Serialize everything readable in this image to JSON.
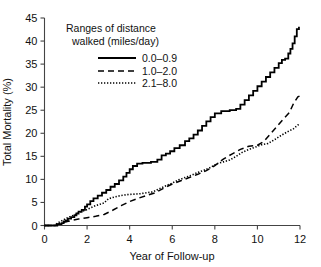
{
  "chart_data": {
    "type": "line",
    "title": "",
    "xlabel": "Year of Follow-up",
    "ylabel": "Total Mortality (%)",
    "xlim": [
      0,
      12
    ],
    "ylim": [
      0,
      45
    ],
    "xticks": [
      "0",
      "2",
      "4",
      "6",
      "8",
      "10",
      "12"
    ],
    "yticks": [
      "0",
      "5",
      "10",
      "15",
      "20",
      "25",
      "30",
      "35",
      "40",
      "45"
    ],
    "grid": false,
    "legend_position": "upper-left-inside",
    "legend_title_line1": "Ranges of distance",
    "legend_title_line2": "walked (miles/day)",
    "series": [
      {
        "name": "0.0–0.9",
        "style": "solid",
        "points": [
          [
            0.0,
            0.0
          ],
          [
            0.5,
            0.0
          ],
          [
            0.6,
            0.3
          ],
          [
            0.8,
            0.5
          ],
          [
            0.9,
            0.9
          ],
          [
            1.0,
            1.1
          ],
          [
            1.1,
            1.5
          ],
          [
            1.25,
            1.8
          ],
          [
            1.4,
            2.2
          ],
          [
            1.5,
            2.6
          ],
          [
            1.6,
            3.0
          ],
          [
            1.75,
            3.4
          ],
          [
            1.9,
            4.1
          ],
          [
            2.0,
            4.6
          ],
          [
            2.15,
            5.3
          ],
          [
            2.3,
            5.9
          ],
          [
            2.5,
            6.5
          ],
          [
            2.7,
            7.1
          ],
          [
            2.9,
            7.7
          ],
          [
            3.1,
            8.4
          ],
          [
            3.3,
            9.0
          ],
          [
            3.5,
            9.8
          ],
          [
            3.7,
            10.6
          ],
          [
            3.85,
            11.4
          ],
          [
            4.0,
            12.2
          ],
          [
            4.15,
            12.9
          ],
          [
            4.35,
            13.4
          ],
          [
            4.6,
            13.6
          ],
          [
            5.0,
            13.8
          ],
          [
            5.3,
            14.3
          ],
          [
            5.5,
            15.2
          ],
          [
            5.7,
            15.6
          ],
          [
            5.9,
            16.1
          ],
          [
            6.1,
            16.8
          ],
          [
            6.35,
            17.4
          ],
          [
            6.6,
            18.3
          ],
          [
            6.8,
            18.9
          ],
          [
            7.0,
            19.7
          ],
          [
            7.2,
            20.6
          ],
          [
            7.4,
            21.6
          ],
          [
            7.6,
            22.6
          ],
          [
            7.8,
            23.5
          ],
          [
            8.0,
            24.3
          ],
          [
            8.3,
            24.8
          ],
          [
            8.7,
            25.0
          ],
          [
            9.0,
            25.3
          ],
          [
            9.2,
            26.2
          ],
          [
            9.4,
            27.2
          ],
          [
            9.6,
            28.2
          ],
          [
            9.8,
            29.2
          ],
          [
            10.0,
            30.2
          ],
          [
            10.2,
            31.2
          ],
          [
            10.4,
            32.2
          ],
          [
            10.6,
            33.2
          ],
          [
            10.8,
            34.2
          ],
          [
            11.0,
            35.2
          ],
          [
            11.15,
            35.9
          ],
          [
            11.3,
            36.2
          ],
          [
            11.45,
            37.3
          ],
          [
            11.55,
            38.3
          ],
          [
            11.65,
            39.5
          ],
          [
            11.75,
            41.0
          ],
          [
            11.85,
            42.6
          ],
          [
            11.95,
            43.1
          ]
        ]
      },
      {
        "name": "1.0–2.0",
        "style": "dashed",
        "points": [
          [
            0.0,
            0.0
          ],
          [
            0.5,
            0.0
          ],
          [
            0.7,
            0.4
          ],
          [
            1.0,
            0.8
          ],
          [
            1.3,
            1.1
          ],
          [
            1.6,
            1.4
          ],
          [
            2.0,
            1.7
          ],
          [
            2.4,
            2.0
          ],
          [
            2.8,
            2.4
          ],
          [
            3.2,
            3.3
          ],
          [
            3.6,
            4.3
          ],
          [
            4.0,
            5.2
          ],
          [
            4.4,
            5.9
          ],
          [
            4.8,
            6.5
          ],
          [
            5.2,
            7.1
          ],
          [
            5.6,
            8.1
          ],
          [
            6.0,
            9.0
          ],
          [
            6.4,
            9.7
          ],
          [
            6.8,
            10.4
          ],
          [
            7.2,
            11.1
          ],
          [
            7.6,
            11.9
          ],
          [
            8.0,
            13.0
          ],
          [
            8.4,
            14.4
          ],
          [
            8.8,
            15.5
          ],
          [
            9.2,
            16.5
          ],
          [
            9.6,
            17.2
          ],
          [
            10.0,
            17.4
          ],
          [
            10.3,
            18.2
          ],
          [
            10.6,
            19.8
          ],
          [
            10.9,
            21.4
          ],
          [
            11.2,
            23.0
          ],
          [
            11.5,
            24.5
          ],
          [
            11.7,
            26.5
          ],
          [
            11.9,
            27.9
          ],
          [
            12.0,
            28.1
          ]
        ]
      },
      {
        "name": "2.1–8.0",
        "style": "dotted",
        "points": [
          [
            0.0,
            0.0
          ],
          [
            0.45,
            0.0
          ],
          [
            0.6,
            0.5
          ],
          [
            0.8,
            1.0
          ],
          [
            1.0,
            1.5
          ],
          [
            1.2,
            1.9
          ],
          [
            1.4,
            2.3
          ],
          [
            1.6,
            2.7
          ],
          [
            1.8,
            3.1
          ],
          [
            2.0,
            3.5
          ],
          [
            2.2,
            3.9
          ],
          [
            2.4,
            4.3
          ],
          [
            2.6,
            4.6
          ],
          [
            2.8,
            4.9
          ],
          [
            3.0,
            5.8
          ],
          [
            3.3,
            6.2
          ],
          [
            3.6,
            6.5
          ],
          [
            3.9,
            6.7
          ],
          [
            4.2,
            6.8
          ],
          [
            4.5,
            6.9
          ],
          [
            4.8,
            7.1
          ],
          [
            5.1,
            7.3
          ],
          [
            5.4,
            8.0
          ],
          [
            5.7,
            8.6
          ],
          [
            6.0,
            9.2
          ],
          [
            6.3,
            9.9
          ],
          [
            6.6,
            10.4
          ],
          [
            6.9,
            10.9
          ],
          [
            7.2,
            11.5
          ],
          [
            7.5,
            12.0
          ],
          [
            7.8,
            12.6
          ],
          [
            8.1,
            13.4
          ],
          [
            8.4,
            13.8
          ],
          [
            8.7,
            14.2
          ],
          [
            9.0,
            15.0
          ],
          [
            9.3,
            15.9
          ],
          [
            9.6,
            16.5
          ],
          [
            9.9,
            17.0
          ],
          [
            10.2,
            17.5
          ],
          [
            10.5,
            17.8
          ],
          [
            10.8,
            18.6
          ],
          [
            11.1,
            19.5
          ],
          [
            11.4,
            20.3
          ],
          [
            11.7,
            21.0
          ],
          [
            11.9,
            21.8
          ],
          [
            12.0,
            21.9
          ]
        ]
      }
    ]
  }
}
